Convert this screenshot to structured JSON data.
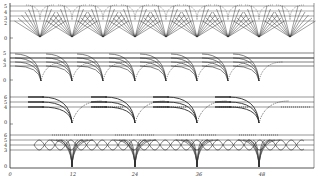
{
  "figure": {
    "x_axis": {
      "ticks": [
        {
          "label": "0",
          "value": 0
        },
        {
          "label": "12",
          "value": 12
        },
        {
          "label": "24",
          "value": 24
        },
        {
          "label": "36",
          "value": 36
        },
        {
          "label": "48",
          "value": 48
        }
      ]
    },
    "panels": [
      {
        "name": "panel-1",
        "y_labels": [
          "5",
          "4",
          "3",
          "2",
          "0"
        ],
        "style": "straight-fans"
      },
      {
        "name": "panel-2",
        "y_labels": [
          "5",
          "4",
          "3",
          "0"
        ],
        "style": "curved-dips"
      },
      {
        "name": "panel-3",
        "y_labels": [
          "6",
          "5",
          "4",
          "0"
        ],
        "style": "curved-dips"
      },
      {
        "name": "panel-4",
        "y_labels": [
          "6",
          "5",
          "4",
          "3",
          "0"
        ],
        "style": "oscillating-loops"
      }
    ],
    "colors": {
      "ink": "#2a2a2a",
      "paper": "#ffffff"
    }
  }
}
